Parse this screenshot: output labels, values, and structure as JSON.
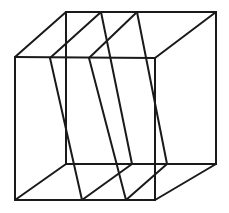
{
  "figure": {
    "stroke_color": "#1a1a1a",
    "stroke_width": 2,
    "background": "#ffffff"
  },
  "cube": {
    "vertices": {
      "front_top_left": [
        15,
        57
      ],
      "front_top_right": [
        155,
        58
      ],
      "front_bottom_left": [
        15,
        200
      ],
      "front_bottom_right": [
        155,
        200
      ],
      "back_top_left": [
        66,
        12
      ],
      "back_top_right": [
        216,
        12
      ],
      "back_bottom_left": [
        66,
        164
      ],
      "back_bottom_right": [
        216,
        164
      ]
    },
    "edges": [
      [
        "front_top_left",
        "front_top_right"
      ],
      [
        "front_top_right",
        "front_bottom_right"
      ],
      [
        "front_bottom_right",
        "front_bottom_left"
      ],
      [
        "front_bottom_left",
        "front_top_left"
      ],
      [
        "back_top_left",
        "back_top_right"
      ],
      [
        "back_top_right",
        "back_bottom_right"
      ],
      [
        "back_bottom_right",
        "back_bottom_left"
      ],
      [
        "back_bottom_left",
        "back_top_left"
      ],
      [
        "front_top_left",
        "back_top_left"
      ],
      [
        "front_top_right",
        "back_top_right"
      ],
      [
        "front_bottom_left",
        "back_bottom_left"
      ],
      [
        "front_bottom_right",
        "back_bottom_right"
      ]
    ]
  },
  "planes": [
    {
      "name": "plane-1",
      "front_top": [
        50,
        58
      ],
      "back_top": [
        101,
        12
      ],
      "back_bottom": [
        132,
        164
      ],
      "front_bottom": [
        82,
        200
      ]
    },
    {
      "name": "plane-2",
      "front_top": [
        89,
        58
      ],
      "back_top": [
        137,
        12
      ],
      "back_bottom": [
        167,
        164
      ],
      "front_bottom": [
        126,
        200
      ]
    }
  ]
}
